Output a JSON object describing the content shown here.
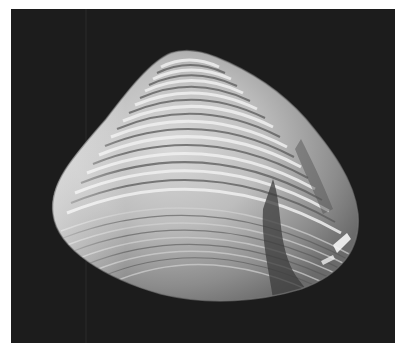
{
  "image": {
    "subject": "clam shell photograph",
    "alt": "Grayscale photograph of a bivalve clam shell with concentric growth ridges on a dark background",
    "colors": {
      "border": "#ffffff",
      "background": "#1c1c1c",
      "shell_light": "#e6e6e6",
      "shell_mid": "#a8a8a8",
      "shell_dark": "#4a4a4a"
    }
  }
}
